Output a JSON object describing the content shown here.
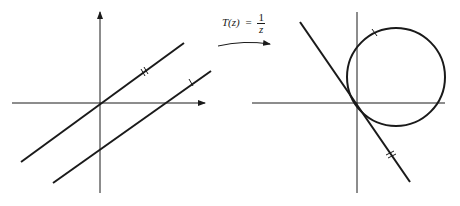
{
  "figure": {
    "mapping_label": {
      "lhs": "T(z)",
      "equals": "=",
      "numerator": "1",
      "denominator": "z"
    },
    "left_panel": {
      "description": "Two parallel lines in the z-plane; one passes through the origin",
      "axes": {
        "x_arrow": true,
        "y_arrow": true
      },
      "lines": [
        {
          "name": "line-through-origin",
          "marker": "double-tick"
        },
        {
          "name": "parallel-line",
          "marker": "single-tick"
        }
      ]
    },
    "right_panel": {
      "description": "Image under T(z)=1/z: a line through the origin and a circle through the origin, tangent to each other",
      "axes": {
        "x_arrow": false,
        "y_arrow": false
      },
      "shapes": [
        {
          "name": "image-line",
          "marker": "double-tick"
        },
        {
          "name": "image-circle",
          "marker": "single-tick"
        }
      ]
    },
    "colors": {
      "stroke": "#1a1a1a",
      "background": "#ffffff"
    }
  }
}
